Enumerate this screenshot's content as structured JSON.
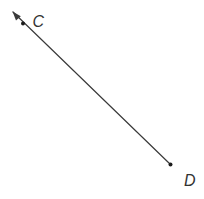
{
  "figure": {
    "background": "#ffffff",
    "stroke_color": "#3a3a3a",
    "point_color": "#1c1c1c",
    "label_color": "#333333",
    "line_path": "M 13,12 L 170.5,164.5",
    "arrow_points": "12.5,11.5 20.8,16.2 16,20.4",
    "points": [
      {
        "label": "C",
        "cx": "23",
        "cy": "23.5",
        "r": "2",
        "label_x": "32.5",
        "label_y": "26.5"
      },
      {
        "label": "D",
        "cx": "170.5",
        "cy": "164.5",
        "r": "2",
        "label_x": "184",
        "label_y": "186"
      }
    ]
  }
}
